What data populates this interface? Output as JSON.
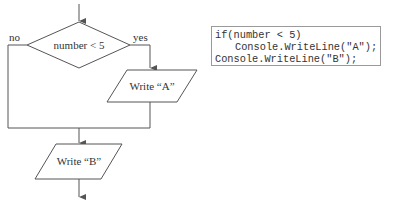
{
  "flowchart": {
    "decision": {
      "label": "number < 5",
      "no_label": "no",
      "yes_label": "yes"
    },
    "process_a": {
      "label": "Write “A”"
    },
    "process_b": {
      "label": "Write “B”"
    }
  },
  "code": {
    "lines": [
      "if(number < 5)",
      "Console.WriteLine(\"A\");",
      "Console.WriteLine(\"B\");"
    ]
  },
  "colors": {
    "stroke": "#555555",
    "text": "#333333"
  }
}
